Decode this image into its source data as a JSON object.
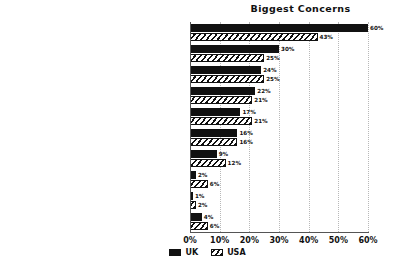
{
  "chart_data": {
    "type": "bar",
    "title": "Biggest Concerns",
    "xlabel": "",
    "ylabel": "",
    "orientation": "horizontal",
    "grid": true,
    "legend_position": "bottom",
    "xlim": [
      0,
      60
    ],
    "xticks": [
      "0%",
      "10%",
      "20%",
      "30%",
      "40%",
      "50%",
      "60%"
    ],
    "xtick_values": [
      0,
      10,
      20,
      30,
      40,
      50,
      60
    ],
    "categories": [
      "The future of the planet and environment",
      "Growing inequality",
      "Global political unrest and/or war",
      "Crime and violence",
      "Economic slowdown or crisis",
      "Social and civil tensions",
      "Where technology is taking us",
      "Other",
      "None of these",
      "Don't know"
    ],
    "series": [
      {
        "name": "UK",
        "color": "#111111",
        "pattern": "solid",
        "values": [
          60,
          30,
          24,
          22,
          17,
          16,
          9,
          2,
          1,
          4
        ],
        "labels": [
          "60%",
          "30%",
          "24%",
          "22%",
          "17%",
          "16%",
          "9%",
          "2%",
          "1%",
          "4%"
        ]
      },
      {
        "name": "USA",
        "color": "#111111",
        "pattern": "diagonal-hatch",
        "values": [
          43,
          25,
          25,
          21,
          21,
          16,
          12,
          6,
          2,
          6
        ],
        "labels": [
          "43%",
          "25%",
          "25%",
          "21%",
          "21%",
          "16%",
          "12%",
          "6%",
          "2%",
          "6%"
        ]
      }
    ]
  },
  "legend": {
    "items": [
      {
        "label": "UK"
      },
      {
        "label": "USA"
      }
    ]
  }
}
